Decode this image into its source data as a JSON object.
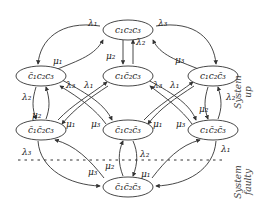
{
  "diagram": {
    "type": "markov-state-diagram",
    "nodes": [
      {
        "id": "n111",
        "label": "c₁c₂c₃",
        "x": 128,
        "y": 30
      },
      {
        "id": "n011",
        "label": "c̄₁c₂c₃",
        "x": 41,
        "y": 76
      },
      {
        "id": "n101",
        "label": "c₁c̄₂c₃",
        "x": 128,
        "y": 76
      },
      {
        "id": "n110",
        "label": "c₁c₂c̄₃",
        "x": 213,
        "y": 76
      },
      {
        "id": "n001",
        "label": "c̄₁c̄₂c₃",
        "x": 41,
        "y": 130
      },
      {
        "id": "n010",
        "label": "c̄₁c₂c̄₃",
        "x": 128,
        "y": 130
      },
      {
        "id": "n100",
        "label": "c₁c̄₂c̄₃",
        "x": 213,
        "y": 130
      },
      {
        "id": "n000",
        "label": "c̄₁c̄₂c̄₃",
        "x": 128,
        "y": 187
      }
    ],
    "edge_labels": {
      "l1": "λ₁",
      "l2": "λ₂",
      "l3": "λ₃",
      "m1": "μ₁",
      "m2": "μ₂",
      "m3": "μ₃"
    },
    "regions": {
      "up": [
        "System",
        "up"
      ],
      "faulty": [
        "System",
        "faulty"
      ]
    }
  }
}
